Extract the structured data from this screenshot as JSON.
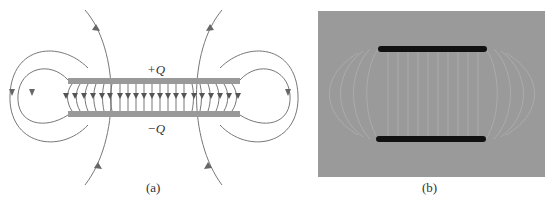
{
  "figure": {
    "panel_a": {
      "caption": "(a)",
      "top_plate_label": "+Q",
      "bottom_plate_label": "−Q",
      "plate_color": "#999999",
      "line_color": "#666666",
      "inner_field_lines": 21
    },
    "panel_b": {
      "caption": "(b)",
      "background_color": "#9a9a9a",
      "plate_color": "#111111"
    }
  }
}
